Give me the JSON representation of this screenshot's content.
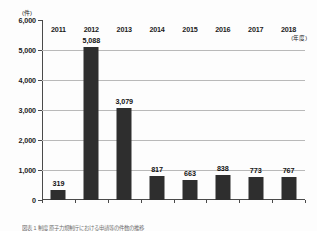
{
  "chart_data": {
    "type": "bar",
    "title": "",
    "subtitle": "",
    "unit_label": "(件)",
    "xlabel": "(年度)",
    "ylabel": "",
    "categories": [
      "2011",
      "2012",
      "2013",
      "2014",
      "2015",
      "2016",
      "2017",
      "2018"
    ],
    "values": [
      319,
      5088,
      3079,
      817,
      663,
      838,
      773,
      767
    ],
    "value_labels": [
      "319",
      "5,088",
      "3,079",
      "817",
      "663",
      "838",
      "773",
      "767"
    ],
    "ylim": [
      0,
      6000
    ],
    "ytick_values": [
      0,
      1000,
      2000,
      3000,
      4000,
      5000,
      6000
    ],
    "ytick_labels": [
      "0",
      "1,000",
      "2,000",
      "3,000",
      "4,000",
      "5,000",
      "6,000"
    ],
    "grid": true,
    "grid_axis": "y",
    "legend": null,
    "series": [
      {
        "name": "件数",
        "values": [
          319,
          5088,
          3079,
          817,
          663,
          838,
          773,
          767
        ],
        "color": "#2e2e2e"
      }
    ],
    "colors": {
      "bar": "#2e2e2e",
      "gridline": "#b9b9b9",
      "axis": "#4a4a4a",
      "text": "#1b1b1b",
      "background": "#fdfdfd"
    }
  },
  "caption": {
    "text": "図表 1 制度 原子力規制庁における申請等の件数の推移"
  }
}
